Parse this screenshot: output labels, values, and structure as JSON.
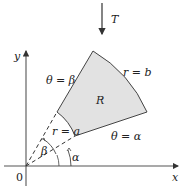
{
  "diagram": {
    "transform_label": "T",
    "axes": {
      "x_label": "x",
      "y_label": "y",
      "origin_label": "0"
    },
    "region_label": "R",
    "boundaries": {
      "outer_arc": "r = b",
      "inner_arc": "r = a",
      "upper_ray": "θ = β",
      "lower_ray": "θ = α"
    },
    "angle_labels": {
      "alpha": "α",
      "beta": "β"
    },
    "colors": {
      "region_fill": "#e2e2e2",
      "stroke": "#333333",
      "text": "#222222"
    }
  }
}
